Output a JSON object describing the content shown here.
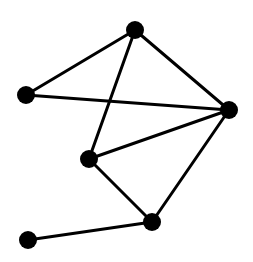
{
  "diagram": {
    "type": "undirected-graph",
    "width": 253,
    "height": 262,
    "colors": {
      "background": "#ffffff",
      "node": "#000000",
      "edge": "#000000"
    },
    "node_radius": 9,
    "edge_width": 3,
    "nodes": [
      {
        "id": "A",
        "x": 135,
        "y": 30
      },
      {
        "id": "B",
        "x": 26,
        "y": 95
      },
      {
        "id": "C",
        "x": 229,
        "y": 110
      },
      {
        "id": "D",
        "x": 89,
        "y": 159
      },
      {
        "id": "E",
        "x": 152,
        "y": 222
      },
      {
        "id": "F",
        "x": 28,
        "y": 240
      }
    ],
    "edges": [
      {
        "from": "A",
        "to": "B"
      },
      {
        "from": "A",
        "to": "C"
      },
      {
        "from": "A",
        "to": "D"
      },
      {
        "from": "B",
        "to": "C"
      },
      {
        "from": "D",
        "to": "C"
      },
      {
        "from": "D",
        "to": "E"
      },
      {
        "from": "C",
        "to": "E"
      },
      {
        "from": "E",
        "to": "F"
      }
    ]
  }
}
